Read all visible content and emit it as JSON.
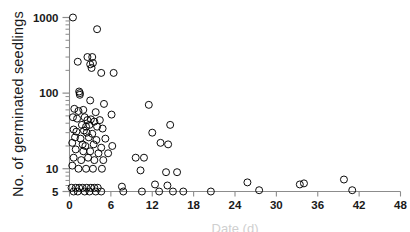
{
  "chart_data": {
    "type": "scatter",
    "title": "",
    "xlabel": "Date (d)",
    "ylabel": "No. of germinated seedlings",
    "xlim": [
      0,
      48
    ],
    "ylim": [
      5,
      1000
    ],
    "yscale": "log",
    "xscale": "linear",
    "xticks": [
      0,
      6,
      12,
      18,
      24,
      30,
      36,
      42,
      48
    ],
    "xtick_labels": [
      "0",
      "6",
      "12",
      "18",
      "24",
      "30",
      "36",
      "42",
      "48"
    ],
    "yticks": [
      5,
      10,
      100,
      1000
    ],
    "ytick_labels": [
      "5",
      "10",
      "100",
      "1000"
    ],
    "grid": false,
    "legend": null,
    "marker": "open-circle",
    "marker_color": "#000000",
    "marker_fill": "none",
    "axis_color": "#8c8c8c",
    "points": [
      [
        0.5,
        1000
      ],
      [
        4.0,
        700
      ],
      [
        1.2,
        260
      ],
      [
        2.6,
        300
      ],
      [
        3.3,
        300
      ],
      [
        3.0,
        240
      ],
      [
        3.2,
        215
      ],
      [
        3.4,
        250
      ],
      [
        4.6,
        185
      ],
      [
        6.4,
        185
      ],
      [
        1.4,
        105
      ],
      [
        1.5,
        100
      ],
      [
        1.5,
        95
      ],
      [
        3.0,
        80
      ],
      [
        5.0,
        72
      ],
      [
        11.5,
        70
      ],
      [
        0.7,
        62
      ],
      [
        1.3,
        58
      ],
      [
        2.0,
        60
      ],
      [
        3.8,
        56
      ],
      [
        6.1,
        52
      ],
      [
        0.5,
        48
      ],
      [
        1.1,
        46
      ],
      [
        2.2,
        48
      ],
      [
        2.6,
        44
      ],
      [
        3.1,
        45
      ],
      [
        3.6,
        42
      ],
      [
        4.4,
        44
      ],
      [
        1.8,
        38
      ],
      [
        2.4,
        36
      ],
      [
        2.9,
        38
      ],
      [
        4.0,
        36
      ],
      [
        4.8,
        34
      ],
      [
        0.6,
        33
      ],
      [
        1.0,
        31
      ],
      [
        2.1,
        32
      ],
      [
        2.5,
        30
      ],
      [
        3.3,
        29
      ],
      [
        12.0,
        30
      ],
      [
        14.6,
        38
      ],
      [
        0.8,
        26
      ],
      [
        1.6,
        25
      ],
      [
        2.8,
        26
      ],
      [
        3.9,
        24
      ],
      [
        5.2,
        25
      ],
      [
        0.4,
        22
      ],
      [
        1.9,
        21
      ],
      [
        2.3,
        20
      ],
      [
        3.5,
        21
      ],
      [
        4.6,
        19
      ],
      [
        6.2,
        20
      ],
      [
        13.2,
        22
      ],
      [
        14.3,
        21
      ],
      [
        0.9,
        18
      ],
      [
        2.0,
        17
      ],
      [
        3.0,
        17
      ],
      [
        4.2,
        16
      ],
      [
        5.6,
        16
      ],
      [
        0.6,
        14
      ],
      [
        1.7,
        13
      ],
      [
        2.7,
        14
      ],
      [
        3.6,
        13
      ],
      [
        4.9,
        13
      ],
      [
        9.6,
        14
      ],
      [
        10.8,
        14
      ],
      [
        0.4,
        11
      ],
      [
        1.3,
        10
      ],
      [
        2.4,
        10
      ],
      [
        3.4,
        10
      ],
      [
        4.7,
        10
      ],
      [
        10.3,
        9.5
      ],
      [
        14.0,
        9
      ],
      [
        15.6,
        9
      ],
      [
        0.3,
        5.6
      ],
      [
        0.9,
        5.6
      ],
      [
        1.4,
        5.6
      ],
      [
        1.9,
        5.6
      ],
      [
        2.5,
        5.6
      ],
      [
        3.1,
        5.6
      ],
      [
        3.6,
        5.6
      ],
      [
        4.1,
        5.6
      ],
      [
        7.6,
        5.8
      ],
      [
        12.4,
        6.2
      ],
      [
        14.2,
        6.0
      ],
      [
        0.6,
        5.0
      ],
      [
        1.2,
        5.0
      ],
      [
        2.2,
        5.0
      ],
      [
        2.9,
        5.0
      ],
      [
        3.8,
        5.0
      ],
      [
        4.6,
        5.0
      ],
      [
        7.8,
        5.0
      ],
      [
        10.5,
        5.0
      ],
      [
        13.0,
        5.0
      ],
      [
        15.0,
        5.0
      ],
      [
        16.5,
        5.0
      ],
      [
        20.5,
        5.0
      ],
      [
        25.8,
        6.6
      ],
      [
        27.5,
        5.2
      ],
      [
        33.4,
        6.2
      ],
      [
        34.0,
        6.4
      ],
      [
        39.8,
        7.2
      ],
      [
        41.0,
        5.2
      ]
    ]
  }
}
